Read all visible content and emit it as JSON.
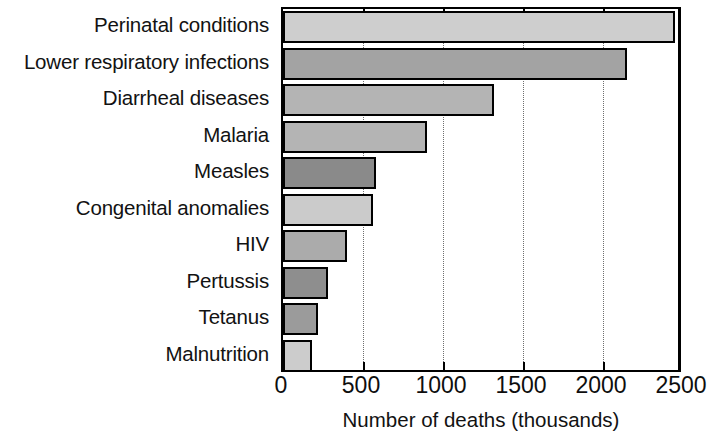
{
  "chart_data": {
    "type": "bar",
    "orientation": "horizontal",
    "title": "",
    "xlabel": "Number of deaths (thousands)",
    "ylabel": "",
    "xlim": [
      0,
      2500
    ],
    "xticks": [
      0,
      500,
      1000,
      1500,
      2000,
      2500
    ],
    "xtick_labels": [
      "0",
      "500",
      "1000",
      "1500",
      "2000",
      "2500"
    ],
    "grid": true,
    "grid_axis": "x",
    "grid_style": "dotted",
    "legend": false,
    "categories": [
      "Perinatal conditions",
      "Lower respiratory infections",
      "Diarrheal diseases",
      "Malaria",
      "Measles",
      "Congenital anomalies",
      "HIV",
      "Pertussis",
      "Tetanus",
      "Malnutrition"
    ],
    "values": [
      2450,
      2150,
      1320,
      900,
      580,
      560,
      400,
      280,
      220,
      180
    ],
    "bar_colors": [
      "#cecece",
      "#a3a3a3",
      "#b4b4b4",
      "#b4b4b4",
      "#8a8a8a",
      "#cbcbcb",
      "#ababab",
      "#8e8e8e",
      "#9b9b9b",
      "#cccccc"
    ],
    "bar_edge_color": "#000000",
    "plot_border_color": "#000000",
    "gridline_color": "#6f6f6f",
    "background_color": "#ffffff"
  }
}
